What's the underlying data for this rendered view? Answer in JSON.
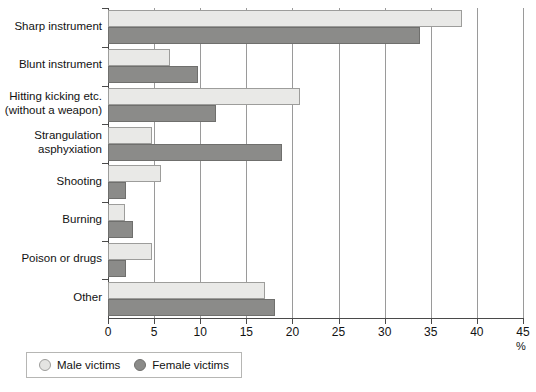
{
  "chart_data": {
    "type": "bar",
    "orientation": "horizontal",
    "title": "",
    "xlabel": "%",
    "ylabel": "",
    "xlim": [
      0,
      45
    ],
    "xticks": [
      0,
      5,
      10,
      15,
      20,
      25,
      30,
      35,
      40,
      45
    ],
    "grid": true,
    "legend_position": "bottom-left",
    "categories": [
      "Sharp instrument",
      "Blunt instrument",
      "Hitting kicking etc.\n(without a weapon)",
      "Strangulation\nasphyxiation",
      "Shooting",
      "Burning",
      "Poison or drugs",
      "Other"
    ],
    "series": [
      {
        "name": "Male victims",
        "color": "#e9e9e7",
        "values": [
          38.4,
          6.7,
          20.8,
          4.8,
          5.7,
          1.8,
          4.8,
          17.0
        ]
      },
      {
        "name": "Female victims",
        "color": "#8b8b89",
        "values": [
          33.8,
          9.8,
          11.7,
          18.9,
          1.9,
          2.7,
          1.9,
          18.1
        ]
      }
    ]
  },
  "axis": {
    "unit_label": "%",
    "tick_labels": [
      "0",
      "5",
      "10",
      "15",
      "20",
      "25",
      "30",
      "35",
      "40",
      "45"
    ]
  },
  "legend": {
    "items": [
      {
        "label": "Male victims",
        "swatch": "circle-light"
      },
      {
        "label": "Female victims",
        "swatch": "circle-dark"
      }
    ]
  },
  "categories_display": [
    {
      "line1": "Sharp instrument",
      "line2": ""
    },
    {
      "line1": "Blunt instrument",
      "line2": ""
    },
    {
      "line1": "Hitting kicking etc.",
      "line2": "(without a weapon)"
    },
    {
      "line1": "Strangulation",
      "line2": "asphyxiation"
    },
    {
      "line1": "Shooting",
      "line2": ""
    },
    {
      "line1": "Burning",
      "line2": ""
    },
    {
      "line1": "Poison or drugs",
      "line2": ""
    },
    {
      "line1": "Other",
      "line2": ""
    }
  ]
}
